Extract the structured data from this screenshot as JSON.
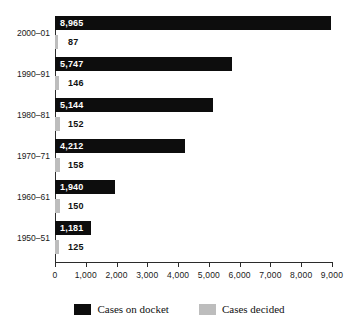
{
  "chart_data": {
    "type": "bar",
    "orientation": "horizontal",
    "title": "",
    "subtitle": "",
    "xlabel": "",
    "ylabel": "",
    "xlim": [
      0,
      9000
    ],
    "xticks": [
      0,
      1000,
      2000,
      3000,
      4000,
      5000,
      6000,
      7000,
      8000,
      9000
    ],
    "xticklabels": [
      "0",
      "1,000",
      "2,000",
      "3,000",
      "4,000",
      "5,000",
      "6,000",
      "7,000",
      "8,000",
      "9,000"
    ],
    "grid": false,
    "legend_position": "bottom-center",
    "categories": [
      "2000–01",
      "1990–91",
      "1980–81",
      "1970–71",
      "1960–61",
      "1950–51"
    ],
    "series": [
      {
        "name": "Cases on docket",
        "color": "#0d0d0d",
        "values": [
          8965,
          5747,
          5144,
          4212,
          1940,
          1181
        ],
        "labels": [
          "8,965",
          "5,747",
          "5,144",
          "4,212",
          "1,940",
          "1,181"
        ]
      },
      {
        "name": "Cases decided",
        "color": "#bdbdbd",
        "values": [
          87,
          146,
          152,
          158,
          150,
          125
        ],
        "labels": [
          "87",
          "146",
          "152",
          "158",
          "150",
          "125"
        ]
      }
    ]
  },
  "legend": {
    "items": [
      {
        "label": "Cases on docket",
        "color": "#0d0d0d"
      },
      {
        "label": "Cases decided",
        "color": "#bdbdbd"
      }
    ]
  },
  "colors": {
    "docket": "#0d0d0d",
    "decided": "#bdbdbd",
    "axis": "#2b2b2b",
    "text": "#1a1a1a",
    "background": "#ffffff"
  }
}
